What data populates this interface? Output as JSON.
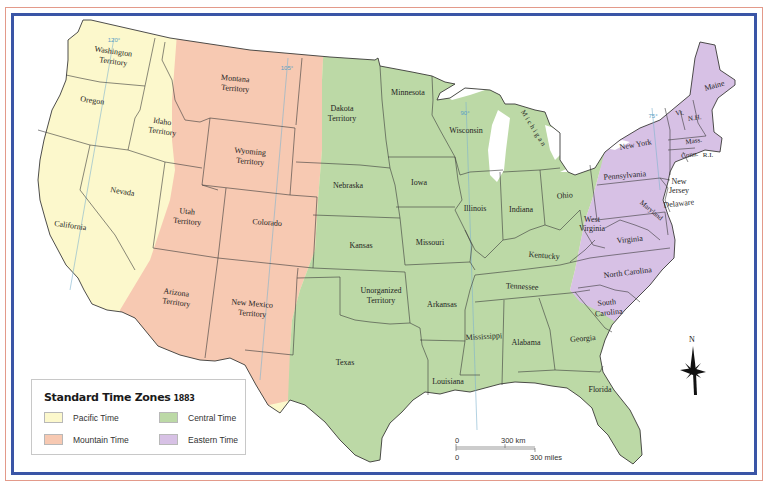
{
  "map": {
    "title": "Standard Time Zones",
    "year": "1883",
    "colors": {
      "pacific": "#fcf8cc",
      "mountain": "#f7c9b2",
      "central": "#bcd9a6",
      "eastern": "#d7c1e5",
      "water": "#ffffff",
      "border_blue": "#3a55a6",
      "frame_red": "#e39a8a",
      "meridian": "#7fb4cf"
    },
    "meridians": [
      "120°",
      "105°",
      "90°",
      "75°"
    ],
    "states": {
      "washington": "Washington",
      "washington2": "Territory",
      "oregon": "Oregon",
      "idaho": "Idaho",
      "idaho2": "Territory",
      "california": "California",
      "nevada": "Nevada",
      "montana": "Montana",
      "montana2": "Territory",
      "wyoming": "Wyoming",
      "wyoming2": "Territory",
      "utah": "Utah",
      "utah2": "Territory",
      "colorado": "Colorado",
      "arizona": "Arizona",
      "arizona2": "Territory",
      "newmexico": "New Mexico",
      "newmexico2": "Territory",
      "dakota": "Dakota",
      "dakota2": "Territory",
      "nebraska": "Nebraska",
      "kansas": "Kansas",
      "unorganized": "Unorganized",
      "unorganized2": "Territory",
      "texas": "Texas",
      "minnesota": "Minnesota",
      "iowa": "Iowa",
      "missouri": "Missouri",
      "arkansas": "Arkansas",
      "louisiana": "Louisiana",
      "wisconsin": "Wisconsin",
      "illinois": "Illinois",
      "michigan": "Michigan",
      "indiana": "Indiana",
      "ohio": "Ohio",
      "kentucky": "Kentucky",
      "tennessee": "Tennessee",
      "mississippi": "Mississippi",
      "alabama": "Alabama",
      "georgia": "Georgia",
      "florida": "Florida",
      "westvirginia": "West",
      "westvirginia2": "Virginia",
      "virginia": "Virginia",
      "northcarolina": "North Carolina",
      "southcarolina": "South",
      "southcarolina2": "Carolina",
      "maryland": "Maryland",
      "delaware": "Delaware",
      "newjersey": "New",
      "newjersey2": "Jersey",
      "pennsylvania": "Pennsylvania",
      "newyork": "New York",
      "vermont": "Vt.",
      "newhampshire": "N.H.",
      "maine": "Maine",
      "massachusetts": "Mass.",
      "connecticut": "Conn.",
      "rhodeisland": "R.I."
    }
  },
  "legend": {
    "title": "Standard Time Zones",
    "year": "1883",
    "items": [
      {
        "label": "Pacific Time",
        "color": "#fcf8cc"
      },
      {
        "label": "Mountain Time",
        "color": "#f7c9b2"
      },
      {
        "label": "Central Time",
        "color": "#bcd9a6"
      },
      {
        "label": "Eastern Time",
        "color": "#d7c1e5"
      }
    ]
  },
  "scale": {
    "zero_km": "0",
    "km_label": "300 km",
    "zero_mi": "0",
    "mi_label": "300 miles"
  },
  "compass": {
    "north": "N"
  }
}
